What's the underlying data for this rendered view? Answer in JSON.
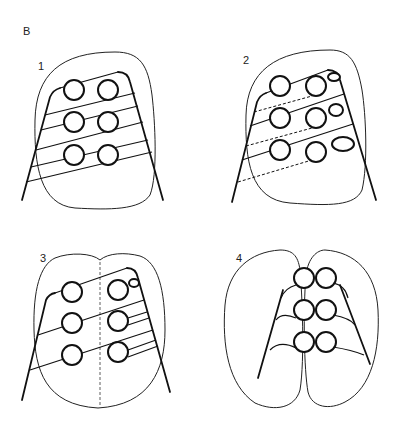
{
  "figure": {
    "panel_letter": "B",
    "panels": [
      {
        "id": "1",
        "label": "1",
        "description": "Single rounded outline with six circles in 2 columns x 3 rows; solid diagonal lines connect circles to left and right trunk lines"
      },
      {
        "id": "2",
        "label": "2",
        "description": "Single outline with six circles; dashed diagonal lines between rows; small bud shapes at right column"
      },
      {
        "id": "3",
        "label": "3",
        "description": "Bilobed outline with a dashed vertical midline; six circles connected to trunk lines"
      },
      {
        "id": "4",
        "label": "4",
        "description": "Two separate oval outlines, each with three circles attached to its own trunk line"
      }
    ],
    "colors": {
      "stroke": "#111111",
      "background": "#ffffff"
    }
  }
}
